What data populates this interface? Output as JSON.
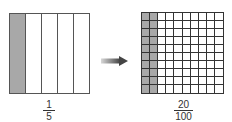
{
  "left": {
    "columns": 5,
    "shaded_columns": 1,
    "fraction": {
      "numerator": "1",
      "denominator": "5"
    }
  },
  "right": {
    "rows": 10,
    "columns": 10,
    "shaded_columns": 2,
    "fraction": {
      "numerator": "20",
      "denominator": "100"
    }
  },
  "colors": {
    "shade": "#a8a8a8",
    "line": "#444444",
    "arrow_dark": "#444444",
    "arrow_light": "#d0d0d0"
  }
}
